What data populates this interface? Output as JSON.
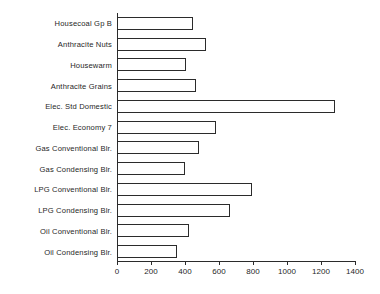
{
  "chart_data": {
    "type": "bar",
    "orientation": "horizontal",
    "title": "",
    "subtitle": "",
    "xlabel": "",
    "ylabel": "",
    "xlim": [
      0,
      1400
    ],
    "xticks": [
      0,
      200,
      400,
      600,
      800,
      1000,
      1200,
      1400
    ],
    "xtick_labels": [
      "0",
      "200",
      "400",
      "600",
      "800",
      "1000",
      "1200",
      "1400"
    ],
    "grid": false,
    "legend": null,
    "bar_style": {
      "fill": "#ffffff",
      "edge": "#2b2b2b"
    },
    "categories": [
      "Housecoal Gp B",
      "Anthracite Nuts",
      "Housewarm",
      "Anthracite Grains",
      "Elec. Std Domestic",
      "Elec. Economy 7",
      "Gas Conventional Blr.",
      "Gas Condensing Blr.",
      "LPG Conventional Blr.",
      "LPG Condensing Blr.",
      "Oil Conventional Blr.",
      "Oil Condensing Blr."
    ],
    "values": [
      447,
      524,
      406,
      465,
      1282,
      582,
      482,
      400,
      794,
      665,
      424,
      353
    ]
  }
}
